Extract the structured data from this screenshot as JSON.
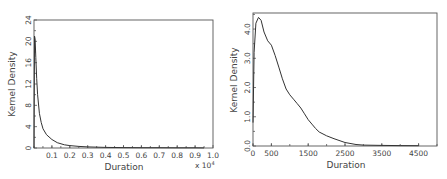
{
  "chart_data": [
    {
      "type": "line",
      "title": "",
      "xlabel": "Duration",
      "ylabel": "Kernel Density",
      "x_multiplier_label": "x 10^4",
      "x_multiplier_text": "x 10",
      "x_multiplier_exp": "4",
      "xlim": [
        0,
        1.0
      ],
      "ylim": [
        0,
        24
      ],
      "xticks": [
        "0.1",
        "0.2",
        "0.3",
        "0.4",
        "0.5",
        "0.6",
        "0.7",
        "0.8",
        "0.9",
        "1.0"
      ],
      "yticks": [
        "0",
        "4",
        "8",
        "12",
        "16",
        "20",
        "24"
      ],
      "grid": false,
      "legend": null,
      "series": [
        {
          "name": "Kernel Density",
          "x": [
            0.0,
            0.003,
            0.006,
            0.01,
            0.015,
            0.02,
            0.03,
            0.04,
            0.05,
            0.07,
            0.1,
            0.13,
            0.17,
            0.2,
            0.25,
            0.3,
            0.4,
            0.5,
            0.6,
            0.7,
            0.8,
            0.9,
            0.95
          ],
          "values": [
            0,
            21,
            20.5,
            17,
            13,
            10,
            6.5,
            4.8,
            3.6,
            2.5,
            1.6,
            1.0,
            0.6,
            0.45,
            0.3,
            0.2,
            0.12,
            0.08,
            0.06,
            0.05,
            0.04,
            0.03,
            0.02
          ]
        }
      ]
    },
    {
      "type": "line",
      "title": "",
      "xlabel": "Duration",
      "ylabel": "Kernel Density",
      "xlim": [
        0,
        5000
      ],
      "ylim": [
        0,
        4.55
      ],
      "xticks": [
        "0",
        "500",
        "1500",
        "2500",
        "3500",
        "4500"
      ],
      "yticks": [
        "0.0",
        "1.0",
        "2.0",
        "3.0",
        "4.0"
      ],
      "grid": false,
      "legend": null,
      "series": [
        {
          "name": "Kernel Density",
          "x": [
            0,
            30,
            80,
            150,
            220,
            300,
            400,
            500,
            600,
            700,
            800,
            900,
            1000,
            1100,
            1200,
            1300,
            1400,
            1500,
            1600,
            1700,
            1800,
            2000,
            2200,
            2500,
            2800,
            3000,
            3500,
            4000,
            4500
          ],
          "values": [
            0.8,
            3.2,
            4.2,
            4.4,
            4.3,
            3.9,
            3.6,
            3.45,
            3.1,
            2.7,
            2.3,
            1.95,
            1.75,
            1.6,
            1.45,
            1.3,
            1.1,
            0.9,
            0.75,
            0.6,
            0.48,
            0.35,
            0.25,
            0.12,
            0.05,
            0.03,
            0.02,
            0.015,
            0.01
          ]
        }
      ]
    }
  ]
}
